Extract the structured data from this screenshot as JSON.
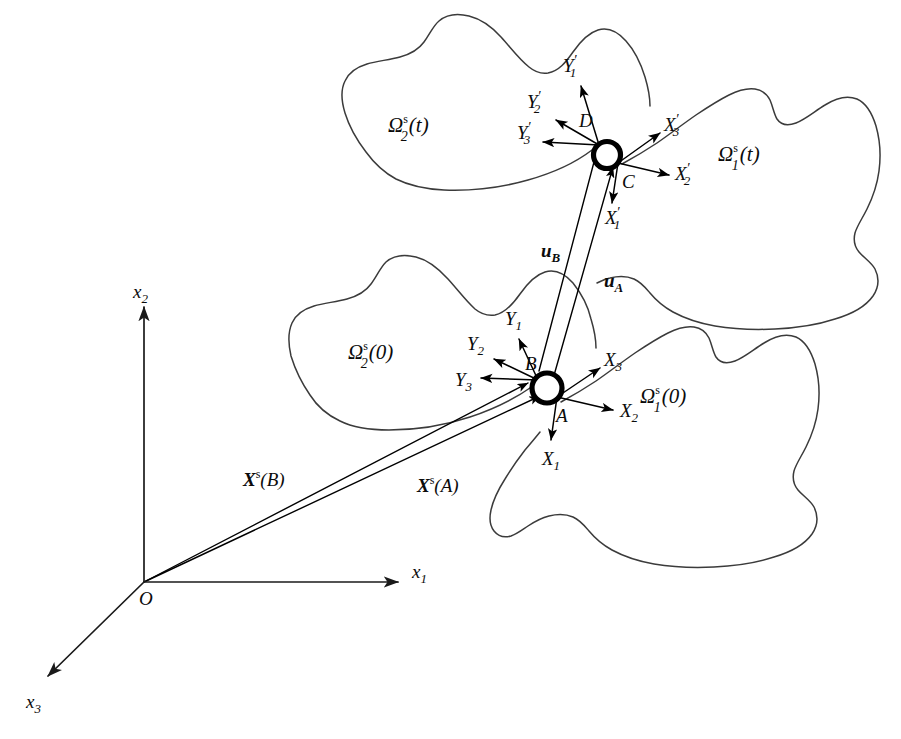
{
  "figure": {
    "background_color": "#ffffff",
    "outline_color": "#3b3b3b",
    "ink_color": "#0b0b0b",
    "width": 901,
    "height": 739
  },
  "global_axes": {
    "origin_label": "O",
    "axis_1": {
      "label": "x",
      "subscript": "1"
    },
    "axis_2": {
      "label": "x",
      "subscript": "2"
    },
    "axis_3": {
      "label": "x",
      "subscript": "3"
    }
  },
  "bodies": [
    {
      "id": "body-2-current",
      "symbol": "Ω",
      "superscript": "s",
      "subscript": "2",
      "argument": "(t)",
      "configuration": "current",
      "position": "upper-left"
    },
    {
      "id": "body-1-current",
      "symbol": "Ω",
      "superscript": "s",
      "subscript": "1",
      "argument": "(t)",
      "configuration": "current",
      "position": "upper-right"
    },
    {
      "id": "body-2-reference",
      "symbol": "Ω",
      "superscript": "s",
      "subscript": "2",
      "argument": "(0)",
      "configuration": "reference",
      "position": "lower-left"
    },
    {
      "id": "body-1-reference",
      "symbol": "Ω",
      "superscript": "s",
      "subscript": "1",
      "argument": "(0)",
      "configuration": "reference",
      "position": "lower-right"
    }
  ],
  "contact_points": [
    {
      "id": "point-A",
      "label": "A",
      "configuration": "reference",
      "body": "1"
    },
    {
      "id": "point-B",
      "label": "B",
      "configuration": "reference",
      "body": "2"
    },
    {
      "id": "point-C",
      "label": "C",
      "configuration": "current",
      "body": "1"
    },
    {
      "id": "point-D",
      "label": "D",
      "configuration": "current",
      "body": "2"
    }
  ],
  "local_frames": {
    "X_reference": [
      {
        "label": "X",
        "subscript": "1"
      },
      {
        "label": "X",
        "subscript": "2"
      },
      {
        "label": "X",
        "subscript": "3"
      }
    ],
    "Y_reference": [
      {
        "label": "Y",
        "subscript": "1"
      },
      {
        "label": "Y",
        "subscript": "2"
      },
      {
        "label": "Y",
        "subscript": "3"
      }
    ],
    "X_current": [
      {
        "label": "X",
        "subscript": "1",
        "prime": "′"
      },
      {
        "label": "X",
        "subscript": "2",
        "prime": "′"
      },
      {
        "label": "X",
        "subscript": "3",
        "prime": "′"
      }
    ],
    "Y_current": [
      {
        "label": "Y",
        "subscript": "1",
        "prime": "′"
      },
      {
        "label": "Y",
        "subscript": "2",
        "prime": "′"
      },
      {
        "label": "Y",
        "subscript": "3",
        "prime": "′"
      }
    ]
  },
  "vectors": {
    "displacement_A": {
      "symbol": "u",
      "subscript": "A",
      "bold": true
    },
    "displacement_B": {
      "symbol": "u",
      "subscript": "B",
      "bold": true
    },
    "position_A": {
      "symbol": "X",
      "superscript": "s",
      "argument": "(A)",
      "bold": true
    },
    "position_B": {
      "symbol": "X",
      "superscript": "s",
      "argument": "(B)",
      "bold": true
    }
  },
  "labels": {
    "omega_2_t": "Ω",
    "omega_1_t": "Ω",
    "omega_2_0": "Ω",
    "omega_1_0": "Ω",
    "sup_s": "s",
    "sub_2": "2",
    "sub_1": "1",
    "arg_t": "(t)",
    "arg_0": "(0)",
    "point_A": "A",
    "point_B": "B",
    "point_C": "C",
    "point_D": "D",
    "origin": "O",
    "x": "x",
    "X": "X",
    "Y": "Y",
    "u": "u",
    "one": "1",
    "two": "2",
    "three": "3",
    "prime": "′",
    "arg_A": "(A)",
    "arg_B": "(B)",
    "sub_A": "A",
    "sub_B": "B"
  }
}
